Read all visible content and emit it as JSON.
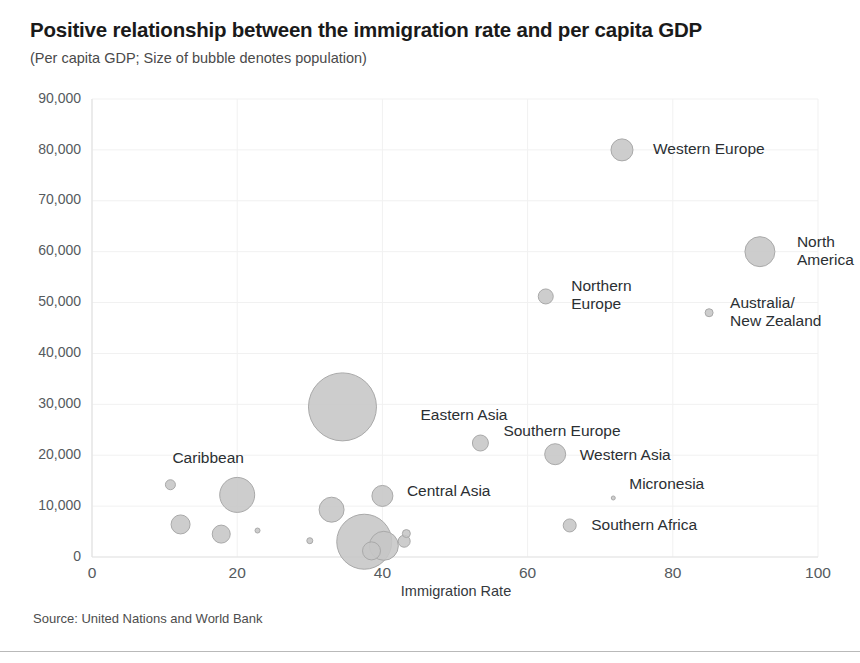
{
  "title": "Positive relationship between the immigration rate and per capita GDP",
  "subtitle": "(Per capita GDP; Size of bubble denotes population)",
  "source_note": "Source: United Nations and World Bank",
  "colors": {
    "bubble_fill": "#c6c6c6",
    "bubble_stroke": "#a9a9a9",
    "grid": "#f1f1f1",
    "text": "#2b2f33"
  },
  "chart_data": {
    "type": "scatter",
    "title": "Positive relationship between the immigration rate and per capita GDP",
    "subtitle": "(Per capita GDP; Size of bubble denotes population)",
    "xlabel": "Immigration Rate",
    "ylabel": "",
    "xlim": [
      0,
      100
    ],
    "ylim": [
      0,
      90000
    ],
    "xticks": [
      0,
      20,
      40,
      60,
      80,
      100
    ],
    "xtick_labels": [
      "0",
      "20",
      "40",
      "60",
      "80",
      "100"
    ],
    "yticks": [
      0,
      10000,
      20000,
      30000,
      40000,
      50000,
      60000,
      70000,
      80000,
      90000
    ],
    "ytick_labels": [
      "0",
      "10,000",
      "20,000",
      "30,000",
      "40,000",
      "50,000",
      "60,000",
      "70,000",
      "80,000",
      "90,000"
    ],
    "grid": true,
    "legend": "none",
    "size_encodes": "population",
    "points": [
      {
        "label": "Western Europe",
        "x": 73.0,
        "y": 80000,
        "r": 11.0,
        "label_dx": 20,
        "label_dy": 0,
        "label_anchor": "start",
        "label_lines": [
          "Western Europe"
        ]
      },
      {
        "label": "North America",
        "x": 92.0,
        "y": 60000,
        "r": 15.0,
        "label_dx": 22,
        "label_dy": -9,
        "label_anchor": "start",
        "label_lines": [
          "North",
          "America"
        ]
      },
      {
        "label": "Australia/New Zealand",
        "x": 85.0,
        "y": 48000,
        "r": 4.0,
        "label_dx": 17,
        "label_dy": -9,
        "label_anchor": "start",
        "label_lines": [
          "Australia/",
          "New Zealand"
        ]
      },
      {
        "label": "Northern Europe",
        "x": 62.5,
        "y": 51200,
        "r": 7.5,
        "label_dx": 18,
        "label_dy": -9,
        "label_anchor": "start",
        "label_lines": [
          "Northern",
          "Europe"
        ]
      },
      {
        "label": "Eastern Asia",
        "x": 34.5,
        "y": 29500,
        "r": 34.0,
        "label_dx": 44,
        "label_dy": 9,
        "label_anchor": "start",
        "label_lines": [
          "Eastern Asia"
        ]
      },
      {
        "label": "Southern Europe",
        "x": 53.5,
        "y": 22400,
        "r": 8.0,
        "label_dx": 15,
        "label_dy": -11,
        "label_anchor": "start",
        "label_lines": [
          "Southern Europe"
        ]
      },
      {
        "label": "Western Asia",
        "x": 63.8,
        "y": 20200,
        "r": 10.5,
        "label_dx": 14,
        "label_dy": 2,
        "label_anchor": "start",
        "label_lines": [
          "Western Asia"
        ]
      },
      {
        "label": "Micronesia",
        "x": 71.8,
        "y": 11600,
        "r": 2.0,
        "label_dx": 14,
        "label_dy": -13,
        "label_anchor": "start",
        "label_lines": [
          "Micronesia"
        ]
      },
      {
        "label": "Southern Africa",
        "x": 65.8,
        "y": 6200,
        "r": 6.5,
        "label_dx": 15,
        "label_dy": 1,
        "label_anchor": "start",
        "label_lines": [
          "Southern Africa"
        ]
      },
      {
        "label": "Caribbean",
        "x": 10.8,
        "y": 14200,
        "r": 5.0,
        "label_dx": -3,
        "label_dy": -26,
        "label_anchor": "start",
        "label_lines": [
          "Caribbean"
        ]
      },
      {
        "label": "Central Asia",
        "x": 40.0,
        "y": 12000,
        "r": 10.5,
        "label_dx": 14,
        "label_dy": -4,
        "label_anchor": "start",
        "label_lines": [
          "Central Asia"
        ]
      },
      {
        "label": "",
        "x": 20.0,
        "y": 12200,
        "r": 17.5,
        "label_dx": 0,
        "label_dy": 0,
        "label_anchor": "start",
        "label_lines": []
      },
      {
        "label": "",
        "x": 12.2,
        "y": 6400,
        "r": 9.5,
        "label_dx": 0,
        "label_dy": 0,
        "label_anchor": "start",
        "label_lines": []
      },
      {
        "label": "",
        "x": 17.8,
        "y": 4500,
        "r": 9.0,
        "label_dx": 0,
        "label_dy": 0,
        "label_anchor": "start",
        "label_lines": []
      },
      {
        "label": "",
        "x": 22.8,
        "y": 5200,
        "r": 2.5,
        "label_dx": 0,
        "label_dy": 0,
        "label_anchor": "start",
        "label_lines": []
      },
      {
        "label": "",
        "x": 33.0,
        "y": 9300,
        "r": 12.5,
        "label_dx": 0,
        "label_dy": 0,
        "label_anchor": "start",
        "label_lines": []
      },
      {
        "label": "",
        "x": 30.0,
        "y": 3200,
        "r": 3.0,
        "label_dx": 0,
        "label_dy": 0,
        "label_anchor": "start",
        "label_lines": []
      },
      {
        "label": "",
        "x": 37.5,
        "y": 3000,
        "r": 27.5,
        "label_dx": 0,
        "label_dy": 0,
        "label_anchor": "start",
        "label_lines": []
      },
      {
        "label": "",
        "x": 40.2,
        "y": 2200,
        "r": 14.5,
        "label_dx": 0,
        "label_dy": 0,
        "label_anchor": "start",
        "label_lines": []
      },
      {
        "label": "",
        "x": 43.0,
        "y": 3100,
        "r": 6.0,
        "label_dx": 0,
        "label_dy": 0,
        "label_anchor": "start",
        "label_lines": []
      },
      {
        "label": "",
        "x": 43.3,
        "y": 4600,
        "r": 4.0,
        "label_dx": 0,
        "label_dy": 0,
        "label_anchor": "start",
        "label_lines": []
      },
      {
        "label": "",
        "x": 38.5,
        "y": 1200,
        "r": 9.0,
        "label_dx": 0,
        "label_dy": 0,
        "label_anchor": "start",
        "label_lines": []
      }
    ]
  }
}
